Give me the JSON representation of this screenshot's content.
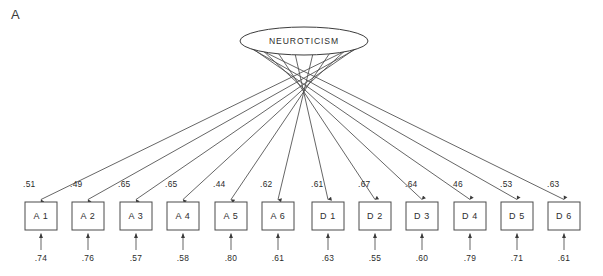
{
  "figure": {
    "panel_label": "A",
    "background_color": "#ffffff",
    "line_color": "#4a4a4a",
    "text_color": "#2b2b2b"
  },
  "chart_data": {
    "type": "diagram",
    "diagram_type": "confirmatory-factor-analysis-path-diagram",
    "title": "A",
    "latent_variables": [
      {
        "name": "NEUROTICISM",
        "shape": "ellipse",
        "center_x": 304,
        "center_y": 41,
        "rx": 64,
        "ry": 14
      }
    ],
    "indicators": [
      {
        "name": "A 1",
        "loading": ".51",
        "residual": ".74",
        "center_x": 41
      },
      {
        "name": "A 2",
        "loading": ".49",
        "residual": ".76",
        "center_x": 88
      },
      {
        "name": "A 3",
        "loading": ".65",
        "residual": ".57",
        "center_x": 136
      },
      {
        "name": "A 4",
        "loading": ".65",
        "residual": ".58",
        "center_x": 183
      },
      {
        "name": "A 5",
        "loading": ".44",
        "residual": ".80",
        "center_x": 231
      },
      {
        "name": "A 6",
        "loading": ".62",
        "residual": ".61",
        "center_x": 278
      },
      {
        "name": "D 1",
        "loading": ".61",
        "residual": ".63",
        "center_x": 328
      },
      {
        "name": "D 2",
        "loading": ".67",
        "residual": ".55",
        "center_x": 375
      },
      {
        "name": "D 3",
        "loading": ".64",
        "residual": ".60",
        "center_x": 422
      },
      {
        "name": "D 4",
        "loading": "46",
        "residual": ".79",
        "center_x": 470
      },
      {
        "name": "D 5",
        "loading": ".53",
        "residual": ".71",
        "center_x": 517
      },
      {
        "name": "D 6",
        "loading": ".63",
        "residual": ".61",
        "center_x": 564
      }
    ],
    "box_width": 32,
    "box_height": 28,
    "box_top": 202,
    "loading_label_y": 187,
    "residual_label_y": 261,
    "residual_tail_y": 250
  }
}
